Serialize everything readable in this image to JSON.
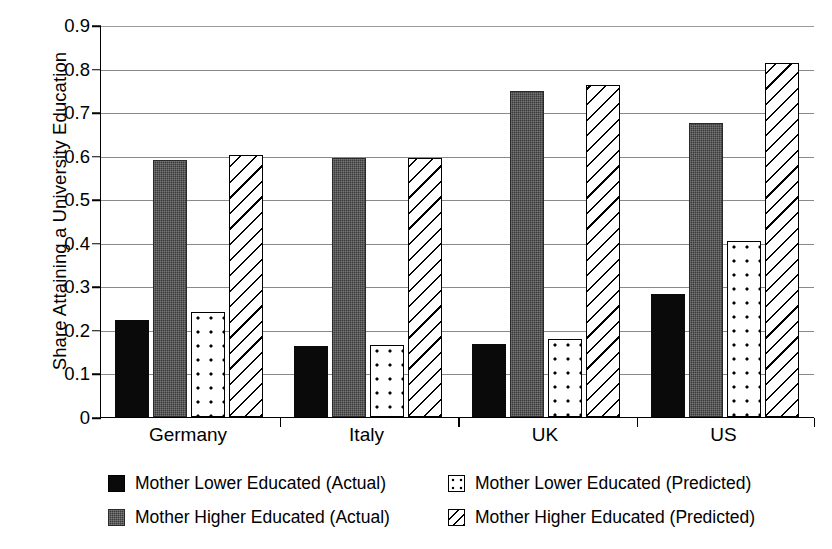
{
  "chart_data": {
    "type": "bar",
    "title": "",
    "xlabel": "",
    "ylabel": "Share Attaining a University Education",
    "ylim": [
      0,
      0.9
    ],
    "yticks": [
      "0",
      "0.1",
      "0.2",
      "0.3",
      "0.4",
      "0.5",
      "0.6",
      "0.7",
      "0.8",
      "0.9"
    ],
    "ytick_values": [
      0,
      0.1,
      0.2,
      0.3,
      0.4,
      0.5,
      0.6,
      0.7,
      0.8,
      0.9
    ],
    "grid": true,
    "legend_position": "bottom",
    "categories": [
      "Germany",
      "Italy",
      "UK",
      "US"
    ],
    "series": [
      {
        "name": "Mother Lower Educated (Actual)",
        "pattern": "solid-black",
        "values": [
          0.222,
          0.163,
          0.168,
          0.283
        ]
      },
      {
        "name": "Mother Higher Educated (Actual)",
        "pattern": "solid-gray",
        "values": [
          0.589,
          0.595,
          0.748,
          0.674
        ]
      },
      {
        "name": "Mother Lower Educated (Predicted)",
        "pattern": "white-dotted",
        "values": [
          0.241,
          0.165,
          0.178,
          0.403
        ]
      },
      {
        "name": "Mother Higher Educated (Predicted)",
        "pattern": "white-hatched",
        "values": [
          0.602,
          0.595,
          0.762,
          0.813
        ]
      }
    ]
  },
  "legend": {
    "items": [
      {
        "label": "Mother Lower Educated (Actual)",
        "swatch": "black"
      },
      {
        "label": "Mother Lower Educated (Predicted)",
        "swatch": "dotted"
      },
      {
        "label": "Mother Higher Educated (Actual)",
        "swatch": "gray"
      },
      {
        "label": "Mother Higher Educated (Predicted)",
        "swatch": "hatched"
      }
    ]
  },
  "colors": {
    "series_actual_lower": "#0a0a0a",
    "series_actual_higher": "#3a3a3a",
    "series_predicted_lower": "#ffffff",
    "series_predicted_higher": "#ffffff",
    "gridline": "#8a8a8a",
    "axis": "#000000",
    "background": "#ffffff"
  }
}
